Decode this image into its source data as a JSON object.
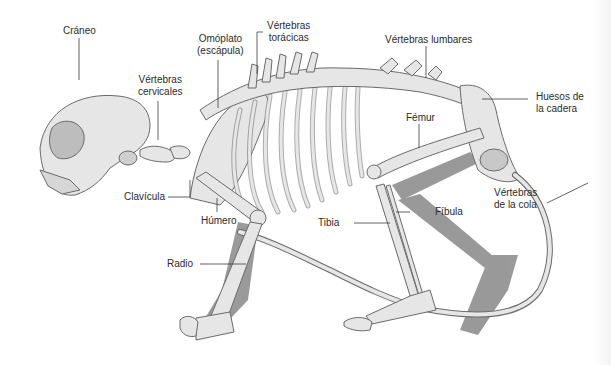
{
  "diagram": {
    "colors": {
      "bone_fill": "#e6e6e6",
      "bone_stroke": "#6a6a6a",
      "shadow": "#8f8f8f",
      "leader_line": "#3a3a3a",
      "label_text": "#2b2b2b",
      "background": "#ffffff"
    },
    "labels": {
      "craneo": "Cráneo",
      "vertebras_cervicales_1": "Vértebras",
      "vertebras_cervicales_2": "cervicales",
      "omoplato_1": "Omóplato",
      "omoplato_2": "(escápula)",
      "vertebras_toracicas_1": "Vértebras",
      "vertebras_toracicas_2": "torácicas",
      "vertebras_lumbares": "Vértebras lumbares",
      "huesos_cadera_1": "Huesos de",
      "huesos_cadera_2": "la cadera",
      "femur": "Fémur",
      "vertebras_cola_1": "Vértebras",
      "vertebras_cola_2": "de la cola",
      "fibula": "Fíbula",
      "tibia": "Tibia",
      "clavicula": "Clavícula",
      "humero": "Húmero",
      "radio": "Radio"
    }
  }
}
